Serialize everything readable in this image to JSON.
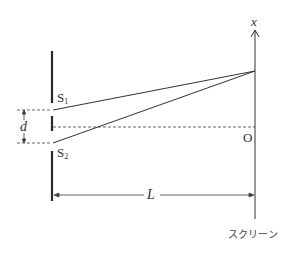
{
  "diagram": {
    "labels": {
      "slit1": "S",
      "slit1_sub": "1",
      "slit2": "S",
      "slit2_sub": "2",
      "slit_separation": "d",
      "distance": "L",
      "origin": "O",
      "axis": "x",
      "screen": "スクリーン"
    },
    "colors": {
      "line": "#333333",
      "wall": "#2a2a2a",
      "dashed": "#555555"
    }
  }
}
